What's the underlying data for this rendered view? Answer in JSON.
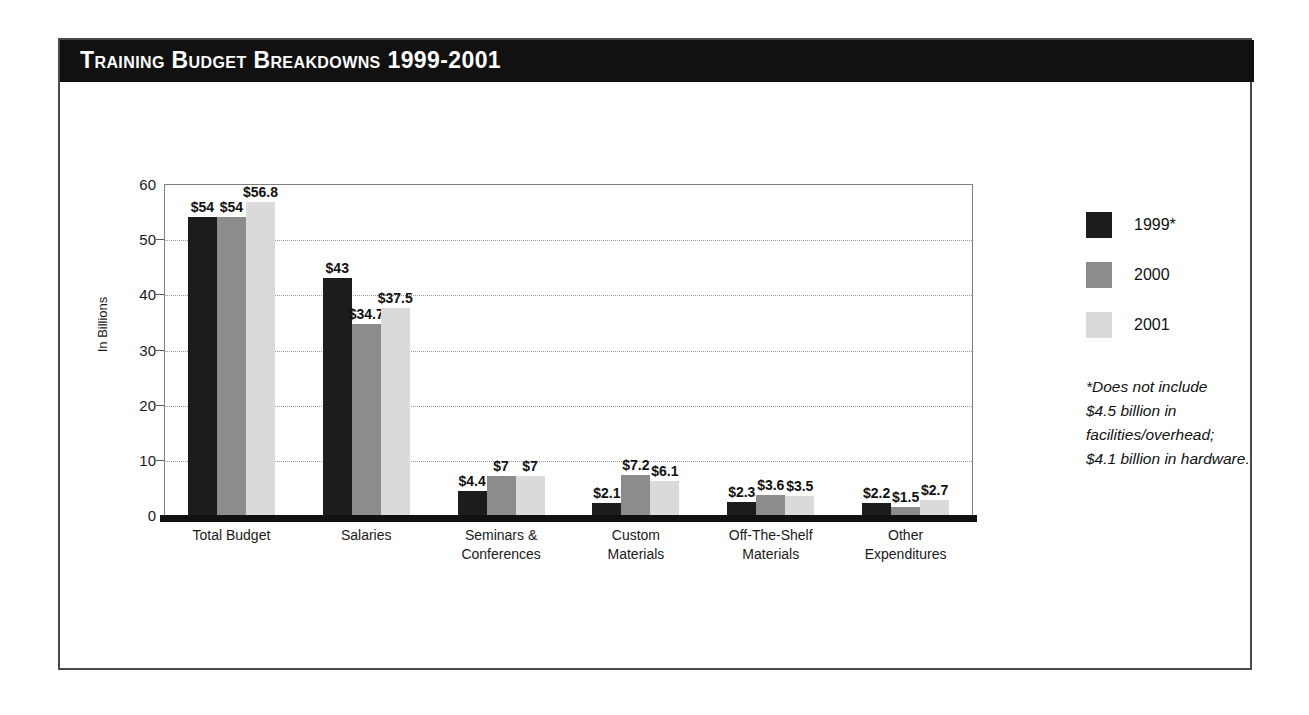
{
  "figure": {
    "title": "Training Budget Breakdowns 1999-2001"
  },
  "legend": {
    "position": "right",
    "entries": [
      {
        "label": "1999*",
        "color": "#1c1c1c",
        "swatch_name": "legend-swatch-1999"
      },
      {
        "label": "2000",
        "color": "#8c8c8c",
        "swatch_name": "legend-swatch-2000"
      },
      {
        "label": "2001",
        "color": "#dadada",
        "swatch_name": "legend-swatch-2001"
      }
    ]
  },
  "footnote": {
    "lines": [
      "*Does not include",
      "$4.5 billion in",
      "facilities/overhead;",
      "$4.1 billion in hardware."
    ]
  },
  "chart_data": {
    "type": "bar",
    "title": "Training Budget Breakdowns 1999-2001",
    "xlabel": "",
    "ylabel": "In Billions",
    "ylim": [
      0,
      60
    ],
    "yticks": [
      0,
      10,
      20,
      30,
      40,
      50,
      60
    ],
    "ytick_labels": [
      "0",
      "10",
      "20",
      "30",
      "40",
      "50",
      "60"
    ],
    "grid": true,
    "grid_axis": "y",
    "categories": [
      "Total Budget",
      "Salaries",
      "Seminars &\nConferences",
      "Custom\nMaterials",
      "Off-The-Shelf\nMaterials",
      "Other\nExpenditures"
    ],
    "category_lines": [
      [
        "Total Budget"
      ],
      [
        "Salaries"
      ],
      [
        "Seminars &",
        "Conferences"
      ],
      [
        "Custom",
        "Materials"
      ],
      [
        "Off-The-Shelf",
        "Materials"
      ],
      [
        "Other",
        "Expenditures"
      ]
    ],
    "series": [
      {
        "name": "1999*",
        "color": "#1c1c1c",
        "values": [
          54,
          43,
          4.4,
          2.1,
          2.3,
          2.2
        ],
        "labels": [
          "$54",
          "$43",
          "$4.4",
          "$2.1",
          "$2.3",
          "$2.2"
        ]
      },
      {
        "name": "2000",
        "color": "#8c8c8c",
        "values": [
          54,
          34.7,
          7,
          7.2,
          3.6,
          1.5
        ],
        "labels": [
          "$54",
          "$34.7",
          "$7",
          "$7.2",
          "$3.6",
          "$1.5"
        ]
      },
      {
        "name": "2001",
        "color": "#dadada",
        "values": [
          56.8,
          37.5,
          7,
          6.1,
          3.5,
          2.7
        ],
        "labels": [
          "$56.8",
          "$37.5",
          "$7",
          "$6.1",
          "$3.5",
          "$2.7"
        ]
      }
    ]
  }
}
